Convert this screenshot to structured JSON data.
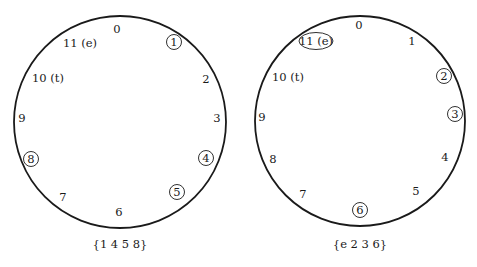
{
  "diagrams": [
    {
      "name": "left-clock",
      "center": [
        120,
        122
      ],
      "radius": 106,
      "caption": "{1 4 5 8}",
      "labels": [
        {
          "text": "0",
          "x": 117,
          "y": 33,
          "circled": false
        },
        {
          "text": "1",
          "x": 174,
          "y": 46,
          "circled": true
        },
        {
          "text": "2",
          "x": 206,
          "y": 83,
          "circled": false
        },
        {
          "text": "3",
          "x": 217,
          "y": 122,
          "circled": false
        },
        {
          "text": "4",
          "x": 206,
          "y": 162,
          "circled": true
        },
        {
          "text": "5",
          "x": 177,
          "y": 196,
          "circled": true
        },
        {
          "text": "6",
          "x": 119,
          "y": 216,
          "circled": false
        },
        {
          "text": "7",
          "x": 63,
          "y": 201,
          "circled": false
        },
        {
          "text": "8",
          "x": 31,
          "y": 163,
          "circled": true
        },
        {
          "text": "9",
          "x": 22,
          "y": 122,
          "circled": false
        },
        {
          "text": "10 (t)",
          "x": 48,
          "y": 82,
          "circled": false
        },
        {
          "text": "11 (e)",
          "x": 80,
          "y": 47,
          "circled": false
        }
      ]
    },
    {
      "name": "right-clock",
      "center": [
        360,
        121
      ],
      "radius": 105,
      "caption": "{e 2 3 6}",
      "labels": [
        {
          "text": "0",
          "x": 359,
          "y": 29,
          "circled": false
        },
        {
          "text": "1",
          "x": 412,
          "y": 45,
          "circled": false
        },
        {
          "text": "2",
          "x": 444,
          "y": 80,
          "circled": true
        },
        {
          "text": "3",
          "x": 455,
          "y": 118,
          "circled": true
        },
        {
          "text": "4",
          "x": 445,
          "y": 161,
          "circled": false
        },
        {
          "text": "5",
          "x": 416,
          "y": 195,
          "circled": false
        },
        {
          "text": "6",
          "x": 360,
          "y": 214,
          "circled": true
        },
        {
          "text": "7",
          "x": 303,
          "y": 198,
          "circled": false
        },
        {
          "text": "8",
          "x": 273,
          "y": 163,
          "circled": false
        },
        {
          "text": "9",
          "x": 262,
          "y": 121,
          "circled": false
        },
        {
          "text": "10 (t)",
          "x": 288,
          "y": 81,
          "circled": false
        },
        {
          "text": "11 (e)",
          "x": 316,
          "y": 45,
          "circled": true,
          "wide": true
        }
      ]
    }
  ]
}
